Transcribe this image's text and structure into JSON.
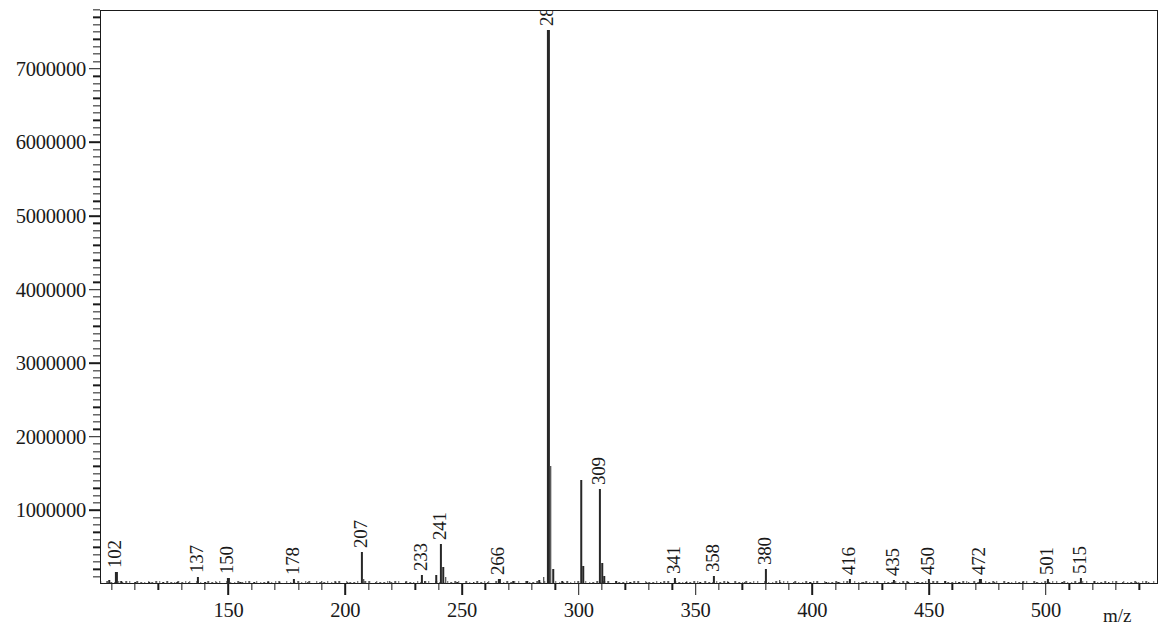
{
  "chart_data": {
    "type": "bar",
    "title": "",
    "subtitle": "",
    "xlabel": "m/z",
    "ylabel": "",
    "grid": false,
    "legend": null,
    "xlim": [
      95,
      548
    ],
    "ylim": [
      0,
      7800000
    ],
    "x_ticks_major": [
      150,
      200,
      250,
      300,
      350,
      400,
      450,
      500
    ],
    "x_tick_labels": [
      "150",
      "200",
      "250",
      "300",
      "350",
      "400",
      "450",
      "500"
    ],
    "x_minor_step": 10,
    "y_ticks_major": [
      1000000,
      2000000,
      3000000,
      4000000,
      5000000,
      6000000,
      7000000
    ],
    "y_tick_labels": [
      "1000000",
      "2000000",
      "3000000",
      "4000000",
      "5000000",
      "6000000",
      "7000000"
    ],
    "y_minor_step": 100000,
    "labeled_peaks": [
      {
        "mz": 102,
        "label": "102",
        "value": 160000
      },
      {
        "mz": 137,
        "label": "137",
        "value": 90000
      },
      {
        "mz": 150,
        "label": "150",
        "value": 80000
      },
      {
        "mz": 178,
        "label": "178",
        "value": 70000
      },
      {
        "mz": 207,
        "label": "207",
        "value": 430000
      },
      {
        "mz": 233,
        "label": "233",
        "value": 120000
      },
      {
        "mz": 241,
        "label": "241",
        "value": 540000
      },
      {
        "mz": 266,
        "label": "266",
        "value": 70000
      },
      {
        "mz": 287,
        "label": "287",
        "value": 7530000
      },
      {
        "mz": 309,
        "label": "309",
        "value": 1290000
      },
      {
        "mz": 341,
        "label": "341",
        "value": 80000
      },
      {
        "mz": 358,
        "label": "358",
        "value": 105000
      },
      {
        "mz": 380,
        "label": "380",
        "value": 210000
      },
      {
        "mz": 416,
        "label": "416",
        "value": 70000
      },
      {
        "mz": 435,
        "label": "435",
        "value": 60000
      },
      {
        "mz": 450,
        "label": "450",
        "value": 70000
      },
      {
        "mz": 472,
        "label": "472",
        "value": 65000
      },
      {
        "mz": 501,
        "label": "501",
        "value": 70000
      },
      {
        "mz": 515,
        "label": "515",
        "value": 75000
      }
    ],
    "unlabeled_peaks": [
      {
        "mz": 99,
        "value": 60000
      },
      {
        "mz": 104,
        "value": 45000
      },
      {
        "mz": 110,
        "value": 30000
      },
      {
        "mz": 116,
        "value": 25000
      },
      {
        "mz": 122,
        "value": 22000
      },
      {
        "mz": 128,
        "value": 26000
      },
      {
        "mz": 133,
        "value": 24000
      },
      {
        "mz": 140,
        "value": 30000
      },
      {
        "mz": 145,
        "value": 22000
      },
      {
        "mz": 155,
        "value": 25000
      },
      {
        "mz": 161,
        "value": 22000
      },
      {
        "mz": 167,
        "value": 26000
      },
      {
        "mz": 172,
        "value": 22000
      },
      {
        "mz": 184,
        "value": 30000
      },
      {
        "mz": 190,
        "value": 45000
      },
      {
        "mz": 196,
        "value": 30000
      },
      {
        "mz": 201,
        "value": 26000
      },
      {
        "mz": 208,
        "value": 70000
      },
      {
        "mz": 213,
        "value": 28000
      },
      {
        "mz": 219,
        "value": 35000
      },
      {
        "mz": 226,
        "value": 26000
      },
      {
        "mz": 234,
        "value": 35000
      },
      {
        "mz": 239,
        "value": 120000
      },
      {
        "mz": 242,
        "value": 230000
      },
      {
        "mz": 243,
        "value": 90000
      },
      {
        "mz": 248,
        "value": 30000
      },
      {
        "mz": 255,
        "value": 26000
      },
      {
        "mz": 261,
        "value": 30000
      },
      {
        "mz": 272,
        "value": 40000
      },
      {
        "mz": 278,
        "value": 45000
      },
      {
        "mz": 283,
        "value": 60000
      },
      {
        "mz": 285,
        "value": 90000
      },
      {
        "mz": 288,
        "value": 1600000
      },
      {
        "mz": 289,
        "value": 200000
      },
      {
        "mz": 293,
        "value": 40000
      },
      {
        "mz": 301,
        "value": 1410000
      },
      {
        "mz": 302,
        "value": 250000
      },
      {
        "mz": 310,
        "value": 280000
      },
      {
        "mz": 311,
        "value": 110000
      },
      {
        "mz": 316,
        "value": 35000
      },
      {
        "mz": 322,
        "value": 28000
      },
      {
        "mz": 329,
        "value": 30000
      },
      {
        "mz": 335,
        "value": 26000
      },
      {
        "mz": 346,
        "value": 30000
      },
      {
        "mz": 352,
        "value": 26000
      },
      {
        "mz": 364,
        "value": 30000
      },
      {
        "mz": 371,
        "value": 26000
      },
      {
        "mz": 386,
        "value": 55000
      },
      {
        "mz": 392,
        "value": 30000
      },
      {
        "mz": 399,
        "value": 32000
      },
      {
        "mz": 406,
        "value": 26000
      },
      {
        "mz": 411,
        "value": 26000
      },
      {
        "mz": 422,
        "value": 30000
      },
      {
        "mz": 428,
        "value": 26000
      },
      {
        "mz": 441,
        "value": 26000
      },
      {
        "mz": 445,
        "value": 30000
      },
      {
        "mz": 457,
        "value": 35000
      },
      {
        "mz": 463,
        "value": 26000
      },
      {
        "mz": 467,
        "value": 30000
      },
      {
        "mz": 478,
        "value": 26000
      },
      {
        "mz": 484,
        "value": 30000
      },
      {
        "mz": 490,
        "value": 26000
      },
      {
        "mz": 496,
        "value": 30000
      },
      {
        "mz": 507,
        "value": 30000
      },
      {
        "mz": 521,
        "value": 35000
      },
      {
        "mz": 527,
        "value": 26000
      },
      {
        "mz": 533,
        "value": 30000
      },
      {
        "mz": 539,
        "value": 26000
      },
      {
        "mz": 544,
        "value": 22000
      }
    ],
    "colors": {
      "trace": "#272727",
      "axis": "#1a1a1a",
      "background": "#ffffff"
    }
  }
}
